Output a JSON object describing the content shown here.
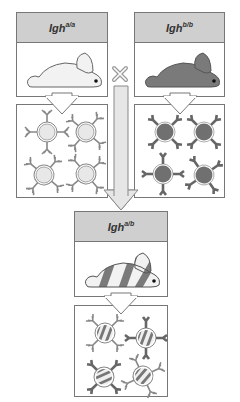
{
  "parents": {
    "left": {
      "genotype_base": "Igh",
      "genotype_sup": "a/a",
      "rabbit_color": "#f2f2f2"
    },
    "right": {
      "genotype_base": "Igh",
      "genotype_sup": "b/b",
      "rabbit_color": "#7a7a7a"
    }
  },
  "cross_symbol": "×",
  "offspring": {
    "genotype_base": "Igh",
    "genotype_sup": "a/b",
    "rabbit_pattern": "striped"
  },
  "colors": {
    "header_fill": "#cfcfcf",
    "border": "#777777",
    "arrow_fill": "#e6e6e6",
    "allotype_a": "#e8e8e8",
    "allotype_b": "#707070"
  }
}
